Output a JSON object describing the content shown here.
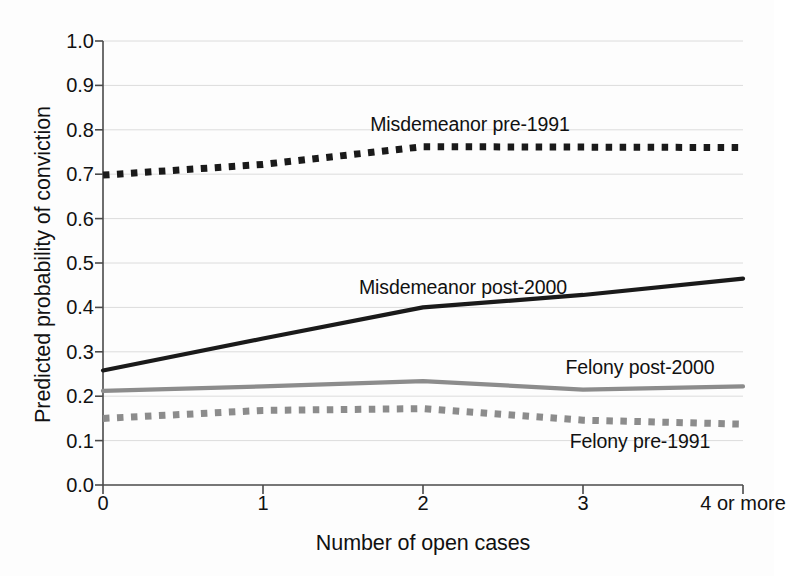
{
  "chart_data": {
    "type": "line",
    "title": "",
    "xlabel": "Number of open cases",
    "ylabel": "Predicted probability of conviction",
    "categories": [
      "0",
      "1",
      "2",
      "3",
      "4 or more"
    ],
    "x": [
      0,
      1,
      2,
      3,
      4
    ],
    "ylim": [
      0.0,
      1.0
    ],
    "ytick_labels": [
      "0.0",
      "0.1",
      "0.2",
      "0.3",
      "0.4",
      "0.5",
      "0.6",
      "0.7",
      "0.8",
      "0.9",
      "1.0"
    ],
    "ytick_values": [
      0.0,
      0.1,
      0.2,
      0.3,
      0.4,
      0.5,
      0.6,
      0.7,
      0.8,
      0.9,
      1.0
    ],
    "grid": true,
    "grid_axis": "y",
    "legend_position": "inline-annotations",
    "series": [
      {
        "name": "Misdemeanor pre-1991",
        "values": [
          0.698,
          0.722,
          0.762,
          0.761,
          0.76
        ],
        "style": "dotted",
        "color": "#1a1a1a",
        "label_x": 470,
        "label_y": 124
      },
      {
        "name": "Misdemeanor post-2000",
        "values": [
          0.258,
          0.33,
          0.4,
          0.428,
          0.465
        ],
        "style": "solid",
        "color": "#1a1a1a",
        "label_x": 463,
        "label_y": 287
      },
      {
        "name": "Felony post-2000",
        "values": [
          0.212,
          0.222,
          0.234,
          0.215,
          0.222
        ],
        "style": "solid",
        "color": "#8c8c8c",
        "label_x": 640,
        "label_y": 367
      },
      {
        "name": "Felony pre-1991",
        "values": [
          0.15,
          0.168,
          0.172,
          0.146,
          0.137
        ],
        "style": "dotted",
        "color": "#8c8c8c",
        "label_x": 640,
        "label_y": 441
      }
    ]
  },
  "axes": {
    "x_tick_labels": [
      "0",
      "1",
      "2",
      "3",
      "4 or more"
    ],
    "y_tick_labels": [
      "0.0",
      "0.1",
      "0.2",
      "0.3",
      "0.4",
      "0.5",
      "0.6",
      "0.7",
      "0.8",
      "0.9",
      "1.0"
    ],
    "x_title": "Number of open cases",
    "y_title": "Predicted probability of conviction"
  },
  "colors": {
    "background": "#fdfdfd",
    "axis": "#4a4a4a",
    "grid": "#dcdcdc",
    "dark_series": "#1a1a1a",
    "light_series": "#8c8c8c"
  }
}
